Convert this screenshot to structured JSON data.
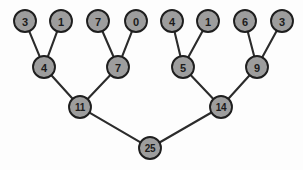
{
  "diagram": {
    "type": "binary-tree",
    "background_color": "#fdfdfd",
    "node_fill_color": "#9d9d9d",
    "node_stroke_color": "#1e1e1e",
    "edge_color": "#2b2b2b",
    "node_radius": 11,
    "nodes": [
      {
        "id": "leaf-1",
        "label": "3",
        "x": 25,
        "y": 21,
        "level": 0
      },
      {
        "id": "leaf-2",
        "label": "1",
        "x": 61,
        "y": 21,
        "level": 0
      },
      {
        "id": "leaf-3",
        "label": "7",
        "x": 98,
        "y": 21,
        "level": 0
      },
      {
        "id": "leaf-4",
        "label": "0",
        "x": 136,
        "y": 21,
        "level": 0
      },
      {
        "id": "leaf-5",
        "label": "4",
        "x": 172,
        "y": 21,
        "level": 0
      },
      {
        "id": "leaf-6",
        "label": "1",
        "x": 208,
        "y": 21,
        "level": 0
      },
      {
        "id": "leaf-7",
        "label": "6",
        "x": 245,
        "y": 21,
        "level": 0
      },
      {
        "id": "leaf-8",
        "label": "3",
        "x": 282,
        "y": 21,
        "level": 0
      },
      {
        "id": "mid-1",
        "label": "4",
        "x": 44,
        "y": 67,
        "level": 1
      },
      {
        "id": "mid-2",
        "label": "7",
        "x": 118,
        "y": 67,
        "level": 1
      },
      {
        "id": "mid-3",
        "label": "5",
        "x": 183,
        "y": 67,
        "level": 1
      },
      {
        "id": "mid-4",
        "label": "9",
        "x": 257,
        "y": 67,
        "level": 1
      },
      {
        "id": "sub-1",
        "label": "11",
        "x": 80,
        "y": 107,
        "level": 2
      },
      {
        "id": "sub-2",
        "label": "14",
        "x": 221,
        "y": 107,
        "level": 2
      },
      {
        "id": "root",
        "label": "25",
        "x": 150,
        "y": 148,
        "level": 3
      }
    ],
    "edges": [
      {
        "from": "leaf-1",
        "to": "mid-1"
      },
      {
        "from": "leaf-2",
        "to": "mid-1"
      },
      {
        "from": "leaf-3",
        "to": "mid-2"
      },
      {
        "from": "leaf-4",
        "to": "mid-2"
      },
      {
        "from": "leaf-5",
        "to": "mid-3"
      },
      {
        "from": "leaf-6",
        "to": "mid-3"
      },
      {
        "from": "leaf-7",
        "to": "mid-4"
      },
      {
        "from": "leaf-8",
        "to": "mid-4"
      },
      {
        "from": "mid-1",
        "to": "sub-1"
      },
      {
        "from": "mid-2",
        "to": "sub-1"
      },
      {
        "from": "mid-3",
        "to": "sub-2"
      },
      {
        "from": "mid-4",
        "to": "sub-2"
      },
      {
        "from": "sub-1",
        "to": "root"
      },
      {
        "from": "sub-2",
        "to": "root"
      }
    ]
  }
}
